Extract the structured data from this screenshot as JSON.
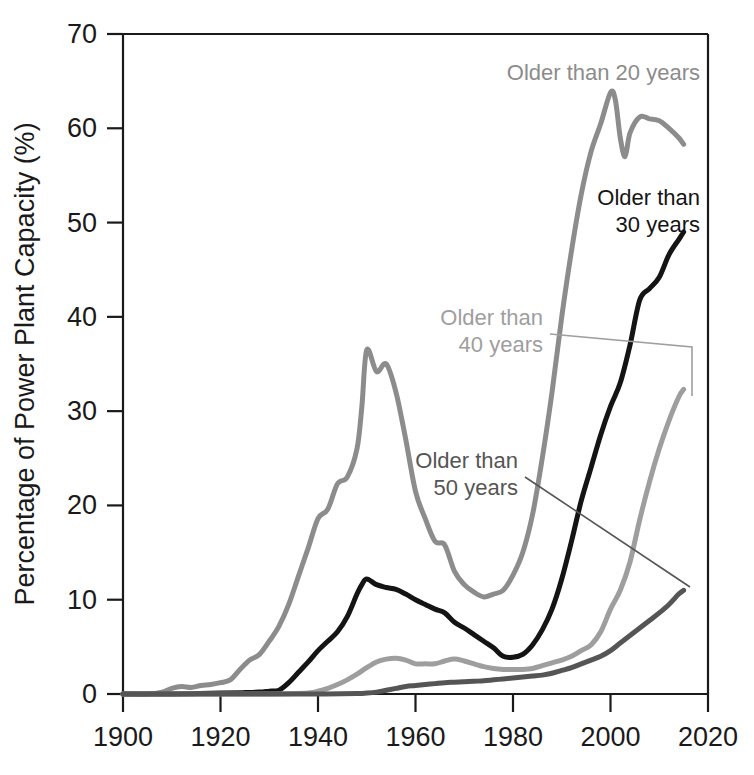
{
  "chart_data": {
    "type": "line",
    "title": "",
    "subtitle": "",
    "xlabel": "",
    "ylabel": "Percentage of Power Plant Capacity (%)",
    "xlim": [
      1900,
      2020
    ],
    "ylim": [
      0,
      70
    ],
    "xticks": [
      1900,
      1920,
      1940,
      1960,
      1980,
      2000,
      2020
    ],
    "xtick_labels": [
      "1900",
      "1920",
      "1940",
      "1960",
      "1980",
      "2000",
      "2020"
    ],
    "yticks": [
      0,
      10,
      20,
      30,
      40,
      50,
      60,
      70
    ],
    "ytick_labels": [
      "0",
      "10",
      "20",
      "30",
      "40",
      "50",
      "60",
      "70"
    ],
    "grid": false,
    "legend_position": "inline-annotations",
    "series": [
      {
        "name": "Older than 20 years",
        "color": "#8c8c8c",
        "linewidth": 5,
        "x": [
          1900,
          1905,
          1908,
          1910,
          1912,
          1914,
          1916,
          1918,
          1920,
          1922,
          1924,
          1926,
          1928,
          1930,
          1932,
          1934,
          1936,
          1938,
          1940,
          1942,
          1944,
          1946,
          1948,
          1949,
          1950,
          1952,
          1954,
          1956,
          1958,
          1960,
          1962,
          1964,
          1966,
          1968,
          1970,
          1972,
          1974,
          1976,
          1978,
          1980,
          1982,
          1984,
          1986,
          1988,
          1990,
          1992,
          1994,
          1996,
          1998,
          2000,
          2001,
          2002,
          2003,
          2004,
          2006,
          2008,
          2010,
          2012,
          2014,
          2015
        ],
        "y": [
          0.0,
          0.0,
          0.2,
          0.6,
          0.8,
          0.7,
          0.9,
          1.0,
          1.2,
          1.5,
          2.6,
          3.6,
          4.2,
          5.6,
          7.2,
          9.5,
          12.5,
          15.5,
          18.6,
          19.6,
          22.3,
          23.0,
          26.0,
          30.5,
          36.5,
          34.2,
          35.0,
          32.0,
          27.0,
          21.5,
          18.6,
          16.2,
          15.8,
          13.0,
          11.6,
          10.8,
          10.3,
          10.6,
          11.0,
          12.6,
          15.0,
          19.0,
          25.0,
          32.0,
          40.0,
          47.0,
          53.0,
          57.5,
          60.5,
          63.8,
          63.0,
          59.0,
          57.0,
          59.5,
          61.2,
          61.0,
          60.8,
          60.0,
          59.0,
          58.3
        ]
      },
      {
        "name": "Older than 30 years",
        "color": "#141414",
        "linewidth": 5,
        "x": [
          1900,
          1910,
          1920,
          1925,
          1928,
          1930,
          1932,
          1934,
          1936,
          1938,
          1940,
          1942,
          1944,
          1946,
          1948,
          1949,
          1950,
          1952,
          1954,
          1956,
          1958,
          1960,
          1962,
          1964,
          1966,
          1968,
          1970,
          1972,
          1974,
          1976,
          1978,
          1980,
          1982,
          1984,
          1986,
          1988,
          1990,
          1992,
          1994,
          1996,
          1998,
          2000,
          2002,
          2004,
          2006,
          2008,
          2010,
          2012,
          2014,
          2015
        ],
        "y": [
          0.0,
          0.0,
          0.1,
          0.15,
          0.2,
          0.3,
          0.4,
          1.2,
          2.3,
          3.4,
          4.6,
          5.6,
          6.6,
          8.2,
          10.6,
          11.6,
          12.2,
          11.6,
          11.3,
          11.1,
          10.6,
          10.0,
          9.5,
          9.0,
          8.6,
          7.6,
          7.0,
          6.3,
          5.6,
          4.9,
          4.0,
          3.9,
          4.2,
          5.2,
          6.8,
          9.0,
          12.2,
          16.2,
          20.5,
          24.0,
          27.5,
          30.5,
          33.0,
          37.0,
          41.8,
          43.0,
          44.2,
          46.6,
          48.2,
          49.0
        ]
      },
      {
        "name": "Older than 40 years",
        "color": "#9e9e9e",
        "linewidth": 5,
        "x": [
          1900,
          1920,
          1930,
          1938,
          1940,
          1942,
          1944,
          1946,
          1948,
          1950,
          1952,
          1954,
          1956,
          1958,
          1960,
          1962,
          1964,
          1966,
          1968,
          1970,
          1972,
          1974,
          1976,
          1978,
          1980,
          1982,
          1984,
          1986,
          1988,
          1990,
          1992,
          1994,
          1996,
          1998,
          2000,
          2002,
          2004,
          2006,
          2008,
          2010,
          2012,
          2014,
          2015
        ],
        "y": [
          0.0,
          0.0,
          0.0,
          0.1,
          0.3,
          0.6,
          1.0,
          1.5,
          2.1,
          2.8,
          3.4,
          3.7,
          3.8,
          3.6,
          3.2,
          3.2,
          3.2,
          3.5,
          3.7,
          3.5,
          3.2,
          2.9,
          2.7,
          2.6,
          2.6,
          2.6,
          2.7,
          3.0,
          3.3,
          3.6,
          4.0,
          4.6,
          5.2,
          6.6,
          9.0,
          11.0,
          14.0,
          18.5,
          22.5,
          26.0,
          29.0,
          31.5,
          32.3
        ]
      },
      {
        "name": "Older than 50 years",
        "color": "#555555",
        "linewidth": 5,
        "x": [
          1900,
          1930,
          1940,
          1948,
          1950,
          1952,
          1954,
          1956,
          1958,
          1960,
          1962,
          1964,
          1966,
          1968,
          1970,
          1972,
          1974,
          1976,
          1978,
          1980,
          1982,
          1984,
          1986,
          1988,
          1990,
          1992,
          1994,
          1996,
          1998,
          2000,
          2002,
          2004,
          2006,
          2008,
          2010,
          2012,
          2014,
          2015
        ],
        "y": [
          0.0,
          0.0,
          0.0,
          0.05,
          0.1,
          0.2,
          0.4,
          0.6,
          0.8,
          0.9,
          1.0,
          1.1,
          1.2,
          1.25,
          1.3,
          1.35,
          1.4,
          1.5,
          1.6,
          1.7,
          1.8,
          1.9,
          2.0,
          2.2,
          2.5,
          2.8,
          3.2,
          3.6,
          4.0,
          4.6,
          5.4,
          6.2,
          7.0,
          7.8,
          8.6,
          9.5,
          10.6,
          11.0
        ]
      }
    ],
    "annotations": [
      {
        "id": "ann-20",
        "text": "Older than 20 years",
        "lines": [
          "Older than 20 years"
        ],
        "color": "#8c8c8c",
        "has_leader": false
      },
      {
        "id": "ann-30",
        "text": "Older than 30 years",
        "lines": [
          "Older than",
          "30 years"
        ],
        "color": "#141414",
        "has_leader": false
      },
      {
        "id": "ann-40",
        "text": "Older than 40 years",
        "lines": [
          "Older than",
          "40 years"
        ],
        "color": "#9e9e9e",
        "has_leader": true
      },
      {
        "id": "ann-50",
        "text": "Older than 50 years",
        "lines": [
          "Older than",
          "50 years"
        ],
        "color": "#555555",
        "has_leader": true
      }
    ]
  },
  "colors": {
    "axis": "#1a1a1a",
    "background": "#ffffff",
    "series_20": "#8c8c8c",
    "series_30": "#141414",
    "series_40": "#9e9e9e",
    "series_50": "#555555"
  }
}
